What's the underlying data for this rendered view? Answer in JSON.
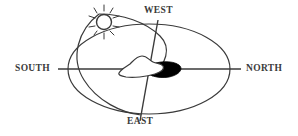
{
  "diagram": {
    "stroke_color": "#3a3a3a",
    "fill_color": "#000000",
    "background_color": "#ffffff",
    "labels": {
      "south": "SOUTH",
      "north": "NORTH",
      "west": "WEST",
      "east": "EAST"
    },
    "elements": {
      "horizon_ellipse": "horizon-ellipse",
      "sun_path_arc": "sun-path-arc",
      "south_north_axis": "south-north-axis-line",
      "west_east_axis": "west-east-axis-line",
      "sun": "sun-icon",
      "observer_landform": "landform-shape",
      "shadow": "shadow-shape"
    }
  }
}
